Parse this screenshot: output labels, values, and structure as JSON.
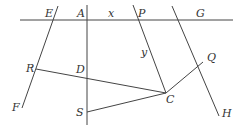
{
  "diagram": {
    "type": "geometry",
    "labels": {
      "E": "E",
      "A": "A",
      "x": "x",
      "P": "P",
      "G": "G",
      "y": "y",
      "R": "R",
      "D": "D",
      "Q": "Q",
      "C": "C",
      "S": "S",
      "F": "F",
      "H": "H"
    },
    "lines": [
      {
        "name": "horizontal-line",
        "from": [
          20,
          20
        ],
        "to": [
          233,
          20
        ]
      },
      {
        "name": "line-AS",
        "from": [
          87,
          5
        ],
        "to": [
          87,
          125
        ]
      },
      {
        "name": "line-EF",
        "from": [
          58,
          6
        ],
        "to": [
          22,
          108
        ]
      },
      {
        "name": "line-PC",
        "from": [
          133,
          5
        ],
        "to": [
          166,
          93
        ]
      },
      {
        "name": "line-GH",
        "from": [
          172,
          6
        ],
        "to": [
          219,
          116
        ]
      },
      {
        "name": "segment-RC",
        "from": [
          36,
          69
        ],
        "to": [
          166,
          93
        ]
      },
      {
        "name": "segment-SC",
        "from": [
          87,
          112
        ],
        "to": [
          166,
          93
        ]
      },
      {
        "name": "segment-CQ",
        "from": [
          166,
          93
        ],
        "to": [
          203,
          62
        ]
      }
    ]
  }
}
